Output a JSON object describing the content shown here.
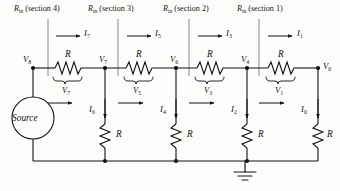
{
  "figure": {
    "ink_color": "#15120f",
    "bg_color": "#fdfdfc"
  },
  "headers": [
    {
      "symbol": "R",
      "sub": "in",
      "paren": "(section 4)",
      "x": 14
    },
    {
      "symbol": "R",
      "sub": "in",
      "paren": "(section 3)",
      "x": 88
    },
    {
      "symbol": "R",
      "sub": "in",
      "paren": "(section 2)",
      "x": 163
    },
    {
      "symbol": "R",
      "sub": "in",
      "paren": "(section 1)",
      "x": 237
    }
  ],
  "series_currents": [
    {
      "symbol": "I",
      "sub": "7",
      "x": 84,
      "y": 33
    },
    {
      "symbol": "I",
      "sub": "5",
      "x": 155,
      "y": 33
    },
    {
      "symbol": "I",
      "sub": "3",
      "x": 226,
      "y": 33
    },
    {
      "symbol": "I",
      "sub": "1",
      "x": 297,
      "y": 33
    }
  ],
  "shunt_currents": [
    {
      "symbol": "I",
      "sub": "6",
      "x": 89,
      "y": 108
    },
    {
      "symbol": "I",
      "sub": "4",
      "x": 160,
      "y": 108
    },
    {
      "symbol": "I",
      "sub": "2",
      "x": 231,
      "y": 108
    },
    {
      "symbol": "I",
      "sub": "0",
      "x": 301,
      "y": 108
    }
  ],
  "node_voltages": [
    {
      "symbol": "V",
      "sub": "8",
      "x": 23,
      "y": 62
    },
    {
      "symbol": "V",
      "sub": "7",
      "x": 100,
      "y": 62
    },
    {
      "symbol": "V",
      "sub": "6",
      "x": 172,
      "y": 62
    },
    {
      "symbol": "V",
      "sub": "4",
      "x": 243,
      "y": 62
    },
    {
      "symbol": "V",
      "sub": "0",
      "x": 320,
      "y": 68
    }
  ],
  "series_resistors": [
    {
      "label": "R",
      "x": 68,
      "y": 59
    },
    {
      "label": "R",
      "x": 139,
      "y": 59
    },
    {
      "label": "R",
      "x": 210,
      "y": 59
    },
    {
      "label": "R",
      "x": 281,
      "y": 59
    }
  ],
  "branch_voltages": [
    {
      "symbol": "V",
      "sub": "7",
      "x": 64,
      "y": 88
    },
    {
      "symbol": "V",
      "sub": "5",
      "x": 135,
      "y": 88
    },
    {
      "symbol": "V",
      "sub": "3",
      "x": 206,
      "y": 88
    },
    {
      "symbol": "V",
      "sub": "1",
      "x": 277,
      "y": 88
    }
  ],
  "shunt_resistors": [
    {
      "label": "R",
      "x": 117,
      "y": 132
    },
    {
      "label": "R",
      "x": 188,
      "y": 132
    },
    {
      "label": "R",
      "x": 259,
      "y": 132
    },
    {
      "label": "R",
      "x": 324,
      "y": 132
    }
  ],
  "source": {
    "label": "Source",
    "cx": 33,
    "cy": 118,
    "r": 21
  },
  "ground": {
    "name": "earth-ground",
    "x": 245,
    "y": 162
  },
  "geometry": {
    "top_rail_y": 68,
    "bottom_rail_y": 161,
    "node_x": [
      33,
      105,
      176,
      247,
      318
    ],
    "divider_x": [
      48,
      118,
      189,
      259
    ],
    "divider_top": 19,
    "divider_bottom": 76
  }
}
